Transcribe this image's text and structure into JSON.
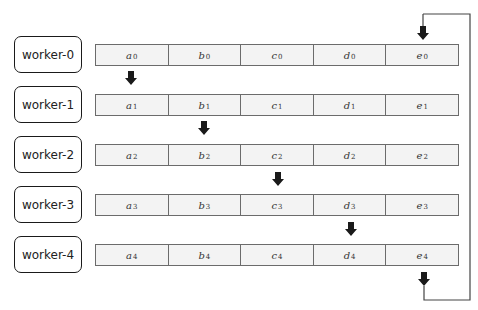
{
  "diagram": {
    "type": "ring-pipeline-data-shift",
    "workers": [
      {
        "label": "worker-0",
        "cells": [
          {
            "v": "a",
            "s": "0"
          },
          {
            "v": "b",
            "s": "0"
          },
          {
            "v": "c",
            "s": "0"
          },
          {
            "v": "d",
            "s": "0"
          },
          {
            "v": "e",
            "s": "0"
          }
        ]
      },
      {
        "label": "worker-1",
        "cells": [
          {
            "v": "a",
            "s": "1"
          },
          {
            "v": "b",
            "s": "1"
          },
          {
            "v": "c",
            "s": "1"
          },
          {
            "v": "d",
            "s": "1"
          },
          {
            "v": "e",
            "s": "1"
          }
        ]
      },
      {
        "label": "worker-2",
        "cells": [
          {
            "v": "a",
            "s": "2"
          },
          {
            "v": "b",
            "s": "2"
          },
          {
            "v": "c",
            "s": "2"
          },
          {
            "v": "d",
            "s": "2"
          },
          {
            "v": "e",
            "s": "2"
          }
        ]
      },
      {
        "label": "worker-3",
        "cells": [
          {
            "v": "a",
            "s": "3"
          },
          {
            "v": "b",
            "s": "3"
          },
          {
            "v": "c",
            "s": "3"
          },
          {
            "v": "d",
            "s": "3"
          },
          {
            "v": "e",
            "s": "3"
          }
        ]
      },
      {
        "label": "worker-4",
        "cells": [
          {
            "v": "a",
            "s": "4"
          },
          {
            "v": "b",
            "s": "4"
          },
          {
            "v": "c",
            "s": "4"
          },
          {
            "v": "d",
            "s": "4"
          },
          {
            "v": "e",
            "s": "4"
          }
        ]
      }
    ],
    "arrows": [
      {
        "from": "worker-0",
        "to": "worker-1",
        "column": "a"
      },
      {
        "from": "worker-1",
        "to": "worker-2",
        "column": "b"
      },
      {
        "from": "worker-2",
        "to": "worker-3",
        "column": "c"
      },
      {
        "from": "worker-3",
        "to": "worker-4",
        "column": "d"
      },
      {
        "from": "worker-4",
        "to": "worker-0",
        "column": "e",
        "wraparound": true
      }
    ],
    "colors": {
      "worker_border": "#1a1a1a",
      "cell_fill": "#f3f3f3",
      "cell_border": "#6b6b6b",
      "arrow": "#1a1a1a",
      "loop_line": "#444444"
    }
  }
}
